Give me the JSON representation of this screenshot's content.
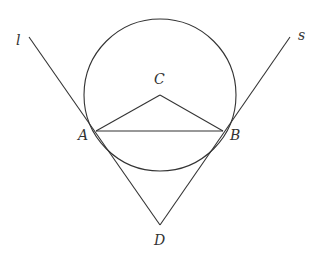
{
  "diagram": {
    "type": "geometry",
    "colors": {
      "stroke": "#333333",
      "background": "#ffffff"
    },
    "circle": {
      "center": "C",
      "cx": 160,
      "cy": 95,
      "r": 76
    },
    "points": [
      {
        "id": "A",
        "label": "A",
        "x": 96,
        "y": 131,
        "lx": 78,
        "ly": 140
      },
      {
        "id": "B",
        "label": "B",
        "x": 223,
        "y": 131,
        "lx": 230,
        "ly": 140
      },
      {
        "id": "C",
        "label": "C",
        "x": 160,
        "y": 95,
        "lx": 154,
        "ly": 84
      },
      {
        "id": "D",
        "label": "D",
        "x": 160,
        "y": 225,
        "lx": 154,
        "ly": 245
      }
    ],
    "lines": [
      {
        "id": "l",
        "label": "l",
        "x1": 29,
        "y1": 37,
        "x2": 160,
        "y2": 225,
        "lx": 16,
        "ly": 45
      },
      {
        "id": "s",
        "label": "s",
        "x1": 290,
        "y1": 37,
        "x2": 160,
        "y2": 225,
        "lx": 298,
        "ly": 40
      }
    ],
    "segments": [
      {
        "from": "C",
        "to": "A"
      },
      {
        "from": "C",
        "to": "B"
      },
      {
        "from": "A",
        "to": "B"
      }
    ]
  }
}
